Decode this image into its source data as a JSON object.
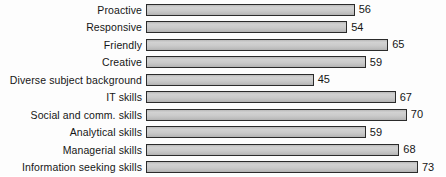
{
  "chart_data": {
    "type": "bar",
    "orientation": "horizontal",
    "title": "",
    "xlabel": "",
    "ylabel": "",
    "xlim": [
      0,
      73
    ],
    "grid": false,
    "legend": false,
    "categories": [
      "Proactive",
      "Responsive",
      "Friendly",
      "Creative",
      "Diverse subject background",
      "IT skills",
      "Social and comm. skills",
      "Analytical skills",
      "Managerial skills",
      "Information seeking skills"
    ],
    "values": [
      56,
      54,
      65,
      59,
      45,
      67,
      70,
      59,
      68,
      73
    ],
    "value_labels": [
      "56",
      "54",
      "65",
      "59",
      "45",
      "67",
      "70",
      "59",
      "68",
      "73"
    ],
    "colors": {
      "bar_fill": "#c8c8c8",
      "bar_border": "#2b2b2b",
      "text": "#161616",
      "background": "#fdfdfd"
    }
  }
}
